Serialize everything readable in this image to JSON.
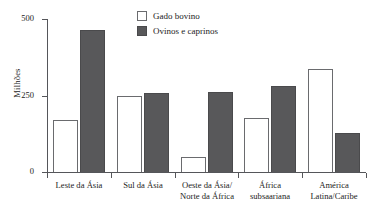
{
  "chart_data": {
    "type": "bar",
    "title": "",
    "xlabel": "",
    "ylabel": "Milhões",
    "ylim": [
      0,
      500
    ],
    "yticks": [
      0,
      250,
      500
    ],
    "ytick_labels": [
      "0",
      "250",
      "500"
    ],
    "grid": false,
    "legend_position": "top-center",
    "categories": [
      "Leste da Ásia",
      "Sul da Ásia",
      "Oeste da Ásia/\nNorte da África",
      "África\nsubsaariana",
      "América\nLatina/Caribe"
    ],
    "category_lines": [
      [
        "Leste da Ásia"
      ],
      [
        "Sul da Ásia"
      ],
      [
        "Oeste da Ásia/",
        "Norte da África"
      ],
      [
        "África",
        "subsaariana"
      ],
      [
        "América",
        "Latina/Caribe"
      ]
    ],
    "series": [
      {
        "name": "Gado bovino",
        "color": "#ffffff",
        "edge_color": "#6a6b6e",
        "values": [
          170,
          248,
          48,
          178,
          338
        ]
      },
      {
        "name": "Ovinos e caprinos",
        "color": "#58585a",
        "edge_color": "#4a4a4c",
        "values": [
          465,
          258,
          262,
          280,
          128
        ]
      }
    ]
  },
  "axis": {
    "y_label": "Milhões",
    "y_tick_500": "500",
    "y_tick_250": "250",
    "y_tick_0": "0"
  },
  "legend": {
    "items": [
      {
        "label": "Gado bovino",
        "swatch": "white-square-swatch"
      },
      {
        "label": "Ovinos e caprinos",
        "swatch": "dark-gray-square-swatch"
      }
    ]
  },
  "colors": {
    "bar_light_fill": "#ffffff",
    "bar_light_edge": "#6a6b6e",
    "bar_dark_fill": "#58585a",
    "bar_dark_edge": "#4a4a4c",
    "axis": "#55565a",
    "text": "#1c1c1c",
    "background": "#ffffff"
  }
}
